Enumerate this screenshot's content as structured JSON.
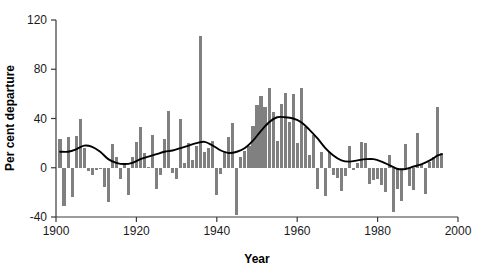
{
  "chart_data": {
    "type": "bar",
    "title": "",
    "xlabel": "Year",
    "ylabel": "Per cent departure",
    "xlim": [
      1900,
      2000
    ],
    "ylim": [
      -40,
      120
    ],
    "xticks": [
      1900,
      1920,
      1940,
      1960,
      1980,
      2000
    ],
    "yticks": [
      -40,
      0,
      40,
      80,
      120
    ],
    "grid": false,
    "legend": null,
    "bar_color": "#808080",
    "trend_color": "#000000",
    "axis_color": "#3a3a3a",
    "background_color": "#ffffff",
    "series": [
      {
        "name": "Per cent departure",
        "type": "bar",
        "x": [
          1901,
          1902,
          1903,
          1904,
          1905,
          1906,
          1907,
          1908,
          1909,
          1910,
          1911,
          1912,
          1913,
          1914,
          1915,
          1916,
          1917,
          1918,
          1919,
          1920,
          1921,
          1922,
          1923,
          1924,
          1925,
          1926,
          1927,
          1928,
          1929,
          1930,
          1931,
          1932,
          1933,
          1934,
          1935,
          1936,
          1937,
          1938,
          1939,
          1940,
          1941,
          1942,
          1943,
          1944,
          1945,
          1946,
          1947,
          1948,
          1949,
          1950,
          1951,
          1952,
          1953,
          1954,
          1955,
          1956,
          1957,
          1958,
          1959,
          1960,
          1961,
          1962,
          1963,
          1964,
          1965,
          1966,
          1967,
          1968,
          1969,
          1970,
          1971,
          1972,
          1973,
          1974,
          1975,
          1976,
          1977,
          1978,
          1979,
          1980,
          1981,
          1982,
          1983,
          1984,
          1985,
          1986,
          1987,
          1988,
          1989,
          1990,
          1991,
          1992,
          1993,
          1994,
          1995,
          1996
        ],
        "values": [
          23,
          -31,
          25,
          -24,
          26,
          40,
          16,
          -3,
          -6,
          -2,
          -1,
          -16,
          -28,
          19,
          9,
          -9,
          4,
          -22,
          9,
          21,
          33,
          12,
          1,
          27,
          -17,
          -6,
          23,
          46,
          -4,
          -9,
          40,
          4,
          20,
          6,
          18,
          107,
          13,
          16,
          22,
          -22,
          -5,
          14,
          25,
          36,
          -38,
          9,
          14,
          18,
          34,
          51,
          58,
          49,
          65,
          45,
          22,
          52,
          61,
          37,
          60,
          20,
          65,
          33,
          10,
          27,
          -17,
          13,
          -23,
          13,
          -6,
          -8,
          -19,
          -7,
          18,
          -2,
          4,
          21,
          20,
          -13,
          -10,
          -9,
          -14,
          -20,
          10,
          -36,
          -17,
          -27,
          19,
          -15,
          -18,
          28,
          3,
          -21,
          5,
          9,
          49,
          12
        ]
      },
      {
        "name": "Smoothed trend",
        "type": "line",
        "x": [
          1901,
          1903,
          1905,
          1907,
          1909,
          1911,
          1913,
          1915,
          1917,
          1919,
          1921,
          1923,
          1925,
          1927,
          1929,
          1931,
          1933,
          1935,
          1937,
          1939,
          1941,
          1943,
          1945,
          1947,
          1949,
          1951,
          1953,
          1955,
          1957,
          1959,
          1961,
          1963,
          1965,
          1967,
          1969,
          1971,
          1973,
          1975,
          1977,
          1979,
          1981,
          1983,
          1985,
          1987,
          1989,
          1991,
          1993,
          1995,
          1996
        ],
        "values": [
          13,
          13,
          15,
          18,
          17,
          13,
          7,
          4,
          3,
          4,
          7,
          9,
          11,
          13,
          14,
          16,
          18,
          20,
          21,
          18,
          14,
          12,
          13,
          16,
          22,
          30,
          37,
          41,
          41,
          40,
          37,
          31,
          24,
          16,
          10,
          6,
          5,
          6,
          7,
          7,
          5,
          2,
          -1,
          -1,
          1,
          3,
          6,
          10,
          11
        ]
      }
    ]
  },
  "axis": {
    "x_tick_labels": [
      "1900",
      "1920",
      "1940",
      "1960",
      "1980",
      "2000"
    ],
    "y_tick_labels": [
      "-40",
      "0",
      "40",
      "80",
      "120"
    ],
    "x_axis_title": "Year",
    "y_axis_title": "Per cent departure"
  }
}
